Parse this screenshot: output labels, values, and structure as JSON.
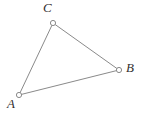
{
  "figure": {
    "type": "triangle-diagram",
    "background_color": "#ffffff",
    "stroke_color": "#8a8a8a",
    "label_color": "#33302f",
    "marker_fill": "#ffffff",
    "marker_radius": 2.6,
    "stroke_width": 1,
    "width": 142,
    "height": 113,
    "vertices": [
      {
        "name": "vertex-A",
        "label": "A",
        "x": 19,
        "y": 95,
        "label_x": 7,
        "label_y": 97
      },
      {
        "name": "vertex-B",
        "label": "B",
        "x": 119,
        "y": 70,
        "label_x": 126,
        "label_y": 61
      },
      {
        "name": "vertex-C",
        "label": "C",
        "x": 53,
        "y": 23,
        "label_x": 43,
        "label_y": 1
      }
    ],
    "edges": [
      {
        "name": "edge-AC",
        "from": "A",
        "to": "C"
      },
      {
        "name": "edge-CB",
        "from": "C",
        "to": "B"
      },
      {
        "name": "edge-AB",
        "from": "A",
        "to": "B"
      }
    ]
  }
}
